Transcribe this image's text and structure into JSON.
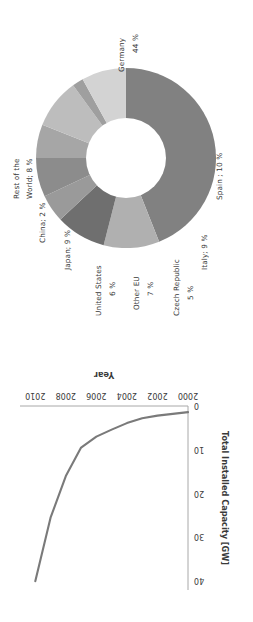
{
  "figure": {
    "background": "#ffffff",
    "text_color": "#3a3a3a",
    "orientation_note": "panels rendered rotated as in source scan"
  },
  "chart_data": [
    {
      "type": "pie",
      "variant": "donut",
      "title": "",
      "subtitle": "",
      "xlabel": "",
      "ylabel": "",
      "legend_position": "outside-labels",
      "grid": false,
      "rotation_deg": -90,
      "units": "%",
      "labels": [
        "Germany; 44 %",
        "Spain ; 10 %",
        "Italy; 9 %",
        "Czech Republic; 5 %",
        "Other EU; 7 %",
        "United States; 6 %",
        "Japan; 9 %",
        "China; 2 %",
        "Rest of the World; 8 %"
      ],
      "categories": [
        "Germany",
        "Spain",
        "Italy",
        "Czech Republic",
        "Other EU",
        "United States",
        "Japan",
        "China",
        "Rest of the World"
      ],
      "values": [
        44,
        10,
        9,
        5,
        7,
        6,
        9,
        2,
        8
      ],
      "colors": [
        "#818181",
        "#b0b0b0",
        "#6f6f6f",
        "#9a9a9a",
        "#8c8c8c",
        "#a6a6a6",
        "#bdbdbd",
        "#9f9f9f",
        "#d3d3d3"
      ],
      "label_parts": [
        {
          "name": "Germany",
          "value": "44 %"
        },
        {
          "name": "Spain",
          "value": "10 %"
        },
        {
          "name": "Italy",
          "value": "9 %"
        },
        {
          "name": "Czech Republic",
          "value": "5 %"
        },
        {
          "name": "Other EU",
          "value": "7 %"
        },
        {
          "name": "United States",
          "value": "6 %"
        },
        {
          "name": "Japan",
          "value": "9 %"
        },
        {
          "name": "China",
          "value": "2 %"
        },
        {
          "name": "Rest of the World",
          "value": "8 %"
        }
      ]
    },
    {
      "type": "line",
      "title": "",
      "xlabel": "Year",
      "ylabel": "Total Installed Capacity [GW]",
      "rotation_deg": 180,
      "grid": false,
      "legend_position": "none",
      "line_color": "#7a7a7a",
      "xlim": [
        2000,
        2011
      ],
      "ylim": [
        0,
        42
      ],
      "xticks": [
        "2000",
        "2002",
        "2004",
        "2006",
        "2008",
        "2010"
      ],
      "xtick_values": [
        2000,
        2002,
        2004,
        2006,
        2008,
        2010
      ],
      "yticks": [
        "0",
        "10",
        "20",
        "30",
        "40"
      ],
      "ytick_values": [
        0,
        10,
        20,
        30,
        40
      ],
      "x": [
        2000,
        2001,
        2002,
        2003,
        2004,
        2005,
        2006,
        2007,
        2008,
        2009,
        2010
      ],
      "values": [
        1.4,
        1.8,
        2.2,
        2.8,
        3.9,
        5.4,
        7.0,
        9.5,
        16.0,
        25.5,
        40.0
      ],
      "series": [
        {
          "name": "Total Installed Capacity",
          "values": [
            1.4,
            1.8,
            2.2,
            2.8,
            3.9,
            5.4,
            7.0,
            9.5,
            16.0,
            25.5,
            40.0
          ]
        }
      ]
    }
  ]
}
